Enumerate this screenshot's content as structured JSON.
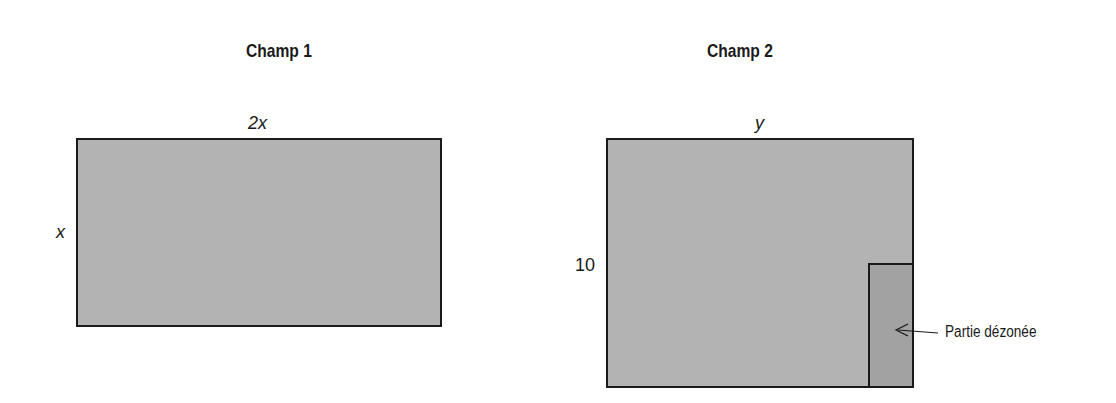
{
  "field1": {
    "title": "Champ 1",
    "top_label": "2x",
    "side_label": "x",
    "fill": "#b3b3b3"
  },
  "field2": {
    "title": "Champ 2",
    "top_label": "y",
    "side_label": "10",
    "fill": "#b3b3b3",
    "rezoned_part": {
      "label": "Partie dézonée",
      "fill": "#a2a2a2"
    }
  }
}
